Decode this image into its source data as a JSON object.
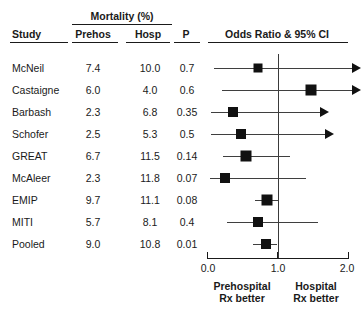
{
  "figure": {
    "type": "forest-plot",
    "background": "#ffffff",
    "marker_color": "#111111",
    "line_color": "#3f3f3f"
  },
  "table_header": {
    "study": "Study",
    "group_label": "Mortality (%)",
    "prehos": "Prehos",
    "hosp": "Hosp",
    "p": "P",
    "plot": "Odds Ratio & 95% CI"
  },
  "axis": {
    "ticks": [
      "0.0",
      "1.0",
      "2.0"
    ],
    "tick_values": [
      0.0,
      1.0,
      2.0
    ],
    "min": 0.0,
    "max": 2.0,
    "reference_line": 1.0,
    "left_caption_line1": "Prehospital",
    "left_caption_line2": "Rx better",
    "right_caption_line1": "Hospital",
    "right_caption_line2": "Rx better"
  },
  "chart_data": {
    "type": "forest",
    "title": "Odds Ratio & 95% CI",
    "xlabel": "Odds Ratio",
    "ylabel": "Study",
    "xlim": [
      0.0,
      2.0
    ],
    "xticks": [
      0.0,
      1.0,
      2.0
    ],
    "reference_line": 1.0,
    "grid": false,
    "legend": "none",
    "columns": [
      "Study",
      "Prehos",
      "Hosp",
      "P",
      "Odds Ratio & 95% CI"
    ],
    "rows": [
      {
        "study": "McNeil",
        "prehos": "7.4",
        "hosp": "10.0",
        "p": "0.7",
        "or": 0.72,
        "ci_low": 0.1,
        "ci_high": 2.05,
        "right_arrow": true,
        "box": 9
      },
      {
        "study": "Castaigne",
        "prehos": "6.0",
        "hosp": "4.0",
        "p": "0.6",
        "or": 1.47,
        "ci_low": 0.21,
        "ci_high": 2.05,
        "right_arrow": true,
        "box": 11
      },
      {
        "study": "Barbash",
        "prehos": "2.3",
        "hosp": "6.8",
        "p": "0.35",
        "or": 0.37,
        "ci_low": 0.05,
        "ci_high": 1.6,
        "right_arrow": true,
        "box": 10
      },
      {
        "study": "Schofer",
        "prehos": "2.5",
        "hosp": "5.3",
        "p": "0.5",
        "or": 0.48,
        "ci_low": 0.06,
        "ci_high": 1.67,
        "right_arrow": true,
        "box": 10
      },
      {
        "study": "GREAT",
        "prehos": "6.7",
        "hosp": "11.5",
        "p": "0.14",
        "or": 0.55,
        "ci_low": 0.23,
        "ci_high": 1.18,
        "right_arrow": false,
        "box": 11
      },
      {
        "study": "McAleer",
        "prehos": "2.3",
        "hosp": "11.8",
        "p": "0.07",
        "or": 0.25,
        "ci_low": 0.04,
        "ci_high": 1.4,
        "right_arrow": false,
        "box": 10
      },
      {
        "study": "EMIP",
        "prehos": "9.7",
        "hosp": "11.1",
        "p": "0.08",
        "or": 0.85,
        "ci_low": 0.68,
        "ci_high": 1.02,
        "right_arrow": false,
        "box": 11
      },
      {
        "study": "MITI",
        "prehos": "5.7",
        "hosp": "8.1",
        "p": "0.4",
        "or": 0.72,
        "ci_low": 0.28,
        "ci_high": 1.58,
        "right_arrow": false,
        "box": 10
      },
      {
        "study": "Pooled",
        "prehos": "9.0",
        "hosp": "10.8",
        "p": "0.01",
        "or": 0.83,
        "ci_low": 0.65,
        "ci_high": 1.0,
        "right_arrow": false,
        "box": 10
      }
    ]
  }
}
